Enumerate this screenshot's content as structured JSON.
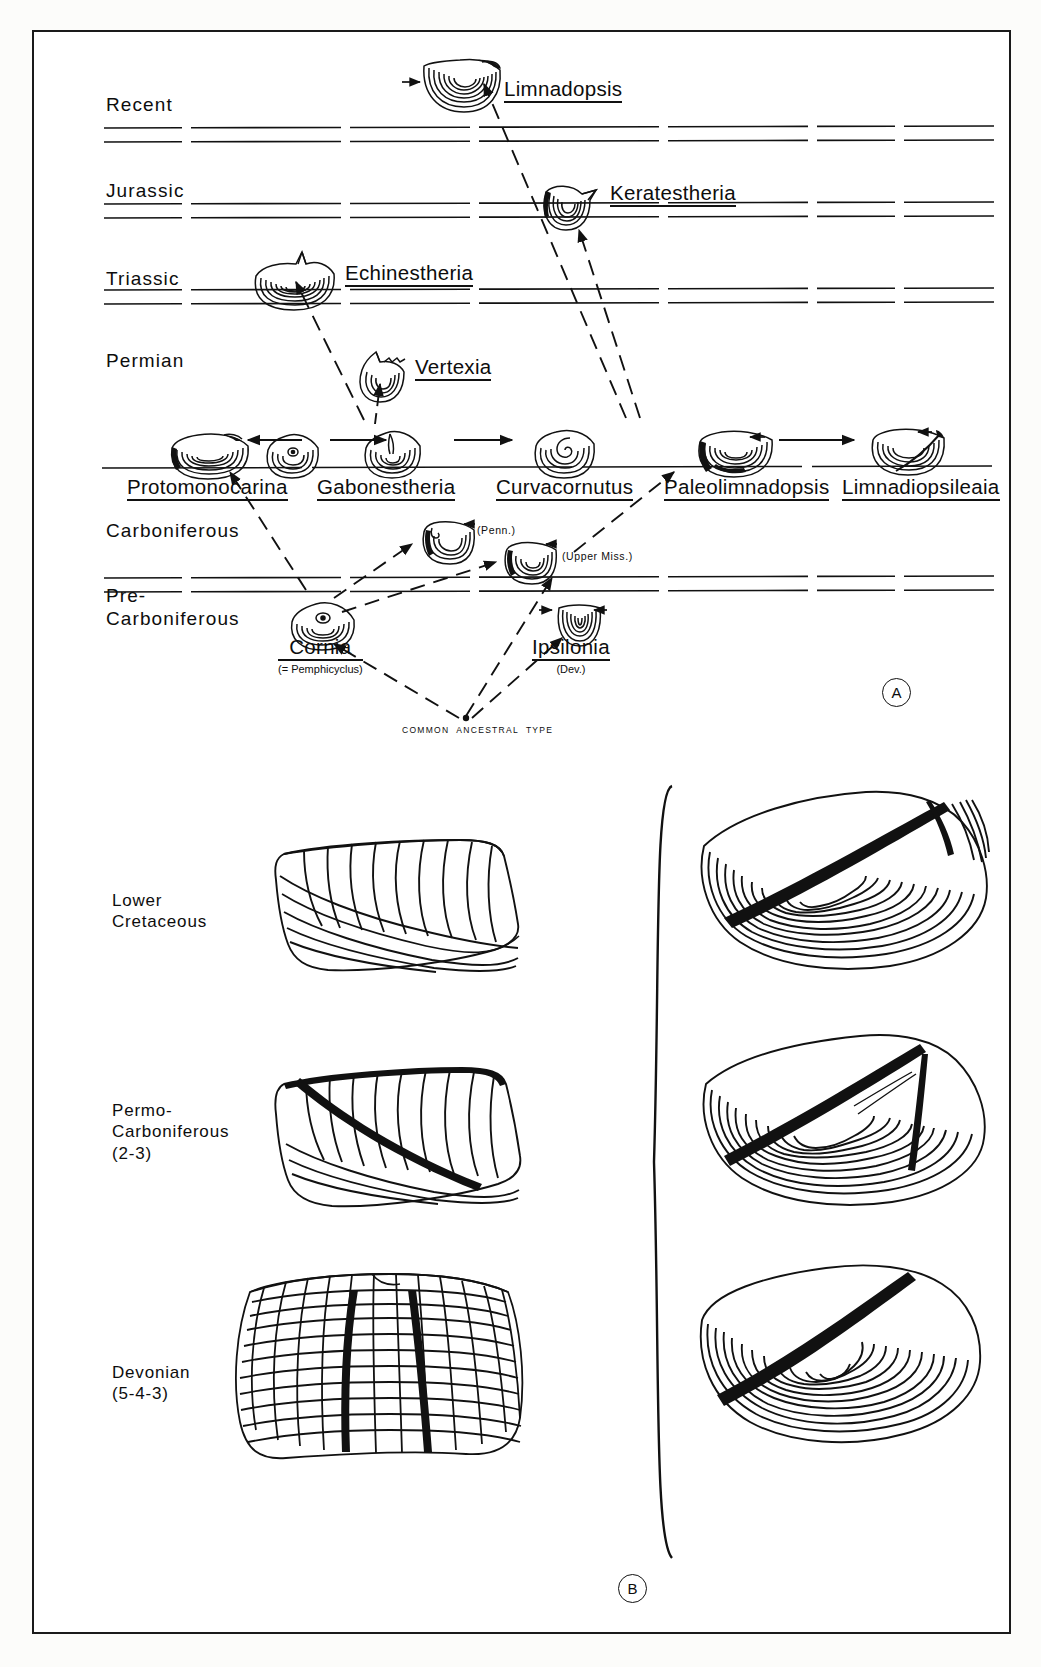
{
  "figure": {
    "panels": [
      {
        "id": "A",
        "label": "A",
        "caption": "Phylogenetic chart of limnadiopseid / estherid genera against geologic time"
      },
      {
        "id": "B",
        "label": "B",
        "caption": "Shell growth-band and radial-rib patterns at three stratigraphic levels"
      }
    ]
  },
  "panel_a": {
    "time_axis_labels": [
      {
        "name": "Recent",
        "text": "Recent",
        "y": 95
      },
      {
        "name": "Jurassic",
        "text": "Jurassic",
        "y": 180
      },
      {
        "name": "Triassic",
        "text": "Triassic",
        "y": 280
      },
      {
        "name": "Permian",
        "text": "Permian",
        "y": 355
      },
      {
        "name": "Carboniferous",
        "text": "Carboniferous",
        "y": 520
      },
      {
        "name": "Pre-Carboniferous",
        "text": "Pre-\nCarboniferous",
        "y": 588
      }
    ],
    "horizon_rows": [
      126,
      140,
      202,
      216,
      288,
      302,
      570,
      584
    ],
    "taxa": [
      {
        "key": "limnadopsis",
        "label": "Limnadopsis",
        "x": 472,
        "y": 60,
        "shell_x": 388,
        "shell_y": 40,
        "annot": ""
      },
      {
        "key": "keratestheria",
        "label": "Keratestheria",
        "x": 578,
        "y": 164,
        "shell_x": 505,
        "shell_y": 152,
        "annot": ""
      },
      {
        "key": "echinestheria",
        "label": "Echinestheria",
        "x": 313,
        "y": 242,
        "shell_x": 218,
        "shell_y": 224,
        "annot": ""
      },
      {
        "key": "vertexia",
        "label": "Vertexia",
        "x": 383,
        "y": 337,
        "shell_x": 322,
        "shell_y": 325,
        "annot": ""
      },
      {
        "key": "protomonocarina",
        "label": "Protomonocarina",
        "x": 126,
        "y": 452,
        "shell_x": 138,
        "shell_y": 405,
        "annot": ""
      },
      {
        "key": "gabonestheria",
        "label": "Gabonestheria",
        "x": 335,
        "y": 452,
        "shell_x": 330,
        "shell_y": 405,
        "annot": ""
      },
      {
        "key": "curvacornutus",
        "label": "Curvacornutus",
        "x": 512,
        "y": 452,
        "shell_x": 500,
        "shell_y": 405,
        "annot": ""
      },
      {
        "key": "paleolimnadopsis",
        "label": "Paleolimnadopsis",
        "x": 687,
        "y": 452,
        "shell_x": 663,
        "shell_y": 405,
        "annot": ""
      },
      {
        "key": "limnadiopsileaia",
        "label": "Limnadiopsileaia",
        "x": 855,
        "y": 452,
        "shell_x": 838,
        "shell_y": 405,
        "annot": ""
      },
      {
        "key": "cornia",
        "label": "Cornia",
        "x": 283,
        "y": 620,
        "shell_x": 258,
        "shell_y": 570,
        "annot": "(= Pemphicyclus)"
      },
      {
        "key": "ipsilonia",
        "label": "Ipsilonia",
        "x": 533,
        "y": 620,
        "shell_x": 525,
        "shell_y": 580,
        "annot": "(Dev.)"
      }
    ],
    "unnamed_shells": [
      {
        "key": "penn-shell",
        "annot": "(Penn.)",
        "shell_x": 388,
        "shell_y": 495,
        "annot_x": 443,
        "annot_y": 500
      },
      {
        "key": "upper-miss-shell",
        "annot": "(Upper Miss.)",
        "shell_x": 470,
        "shell_y": 515,
        "annot_x": 528,
        "annot_y": 524
      }
    ],
    "ancestor_label": "COMMON  ANCESTRAL  TYPE",
    "ancestor_x": 398,
    "ancestor_y": 690,
    "panel_letter": "A",
    "panel_letter_x": 865,
    "panel_letter_y": 660
  },
  "panel_b": {
    "row_labels": [
      {
        "key": "lower-cretaceous",
        "text": "Lower\nCretaceous",
        "y": 860
      },
      {
        "key": "permo-carboniferous",
        "text": "Permo-\nCarboniferous\n(2-3)",
        "y": 1060
      },
      {
        "key": "devonian",
        "text": "Devonian\n(5-4-3)",
        "y": 1290
      }
    ],
    "panel_letter": "B",
    "panel_letter_x": 600,
    "panel_letter_y": 1555,
    "bracket": {
      "x": 650,
      "top": 780,
      "bottom": 1520
    }
  },
  "colors": {
    "ink": "#111111",
    "paper": "#ffffff",
    "page": "#fcfcfa",
    "border": "#1a1a1a"
  }
}
